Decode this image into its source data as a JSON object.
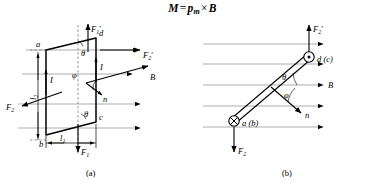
{
  "figure": {
    "title": {
      "lhs": "M",
      "equals": "=",
      "rhs_symbol": "p",
      "rhs_subscript": "m",
      "cross": "×",
      "field": "B"
    },
    "captions": {
      "panel_a": "(a)",
      "panel_b": "(b)"
    }
  },
  "panel_a": {
    "name": "current-loop-perspective-view",
    "vertices": {
      "a": "a",
      "b": "b",
      "c": "c",
      "d": "d"
    },
    "angles": {
      "theta_top": "θ",
      "theta_bottom": "θ",
      "phi": "φ"
    },
    "vectors": {
      "F1_prime": {
        "symbol": "F",
        "sub": "1",
        "prime": "′"
      },
      "F1": {
        "symbol": "F",
        "sub": "1",
        "prime": ""
      },
      "F2_prime": {
        "symbol": "F",
        "sub": "2",
        "prime": "′"
      },
      "F2": {
        "symbol": "F",
        "sub": "2",
        "prime": ""
      },
      "B": "B",
      "n": "n",
      "I_left": "I",
      "I_right": "I"
    },
    "dimensions": {
      "l1": {
        "symbol": "l",
        "sub": "1"
      },
      "l2": {
        "symbol": "l",
        "sub": "2"
      }
    }
  },
  "panel_b": {
    "name": "current-loop-top-view",
    "nodes": {
      "top": "d (c)",
      "bottom": "a (b)"
    },
    "angles": {
      "theta": "θ",
      "phi": "φ"
    },
    "vectors": {
      "F2_prime": {
        "symbol": "F",
        "sub": "2",
        "prime": "′"
      },
      "F2": {
        "symbol": "F",
        "sub": "2",
        "prime": ""
      },
      "B": "B",
      "n": "n"
    }
  },
  "colors": {
    "ink": "#000000",
    "fieldline": "#8b8b8b",
    "background": "#ffffff"
  }
}
